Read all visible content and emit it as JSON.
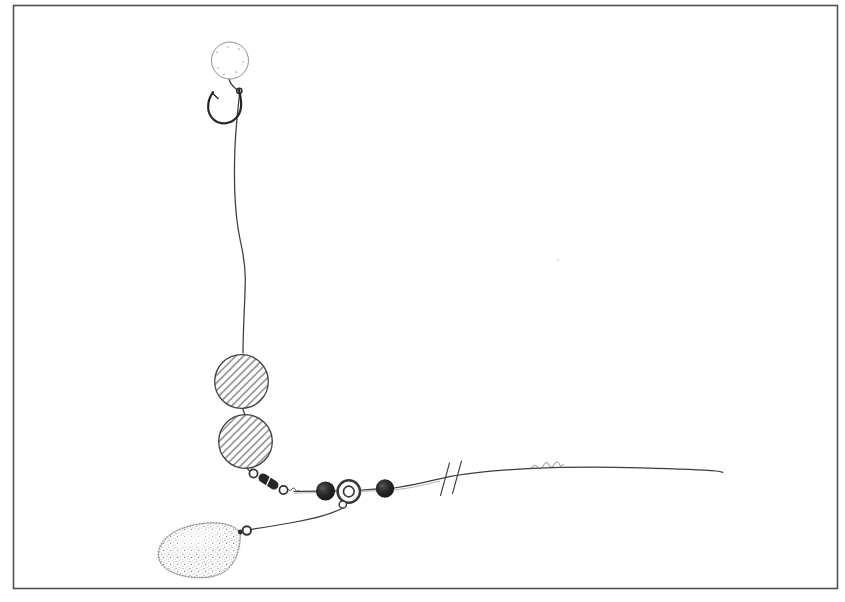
{
  "figure": {
    "kind": "scanned black-and-white line illustration",
    "background": "plain white page with thin rectangular border frame",
    "components": {
      "bait": "pop-up-bait-ball",
      "hook": "fish-hook-with-barb",
      "hooklink": "wavy-hooklink-line",
      "floats": "two-hatched-buoyant-beads",
      "swivel": "barrel-swivel",
      "left_bead": "rubber-bead",
      "ring": "run-ring-with-link-loop",
      "right_bead": "rubber-bead",
      "main_line": "main-line-with-break-marks",
      "signature": "illegible-artist-signature-squiggle",
      "weight_link": "weight-dropper-line",
      "weight": "pear-shaped-lead-weight-with-eyelet"
    }
  },
  "colors": {
    "paper": "#ffffff",
    "frame": "#4f4f4f",
    "ink": "#3c3c3c",
    "ink_dark": "#262626",
    "ink_light": "#8f8f8f",
    "bead_fill": "#1e1e1e",
    "bead_highlight": "#5a5a5a",
    "hatch": "#4c4c4c",
    "stipple": "#6e6e6e",
    "lead_outline": "#9b9b9b"
  }
}
